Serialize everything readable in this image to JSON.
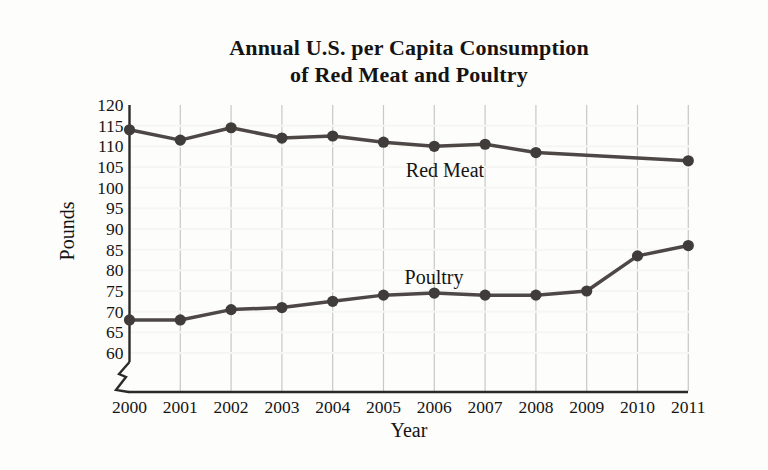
{
  "page": {
    "background": "#fdfdfc"
  },
  "chart_data": {
    "type": "line",
    "title": "Annual U.S. per Capita Consumption",
    "subtitle": "of Red Meat and Poultry",
    "xlabel": "Year",
    "ylabel": "Pounds",
    "x": [
      2000,
      2001,
      2002,
      2003,
      2004,
      2005,
      2006,
      2007,
      2008,
      2009,
      2010,
      2011
    ],
    "y_ticks": [
      120,
      115,
      110,
      105,
      100,
      95,
      90,
      85,
      80,
      75,
      70,
      65,
      60
    ],
    "ylim": [
      60,
      120
    ],
    "axis_break_at_bottom": true,
    "grid": {
      "horizontal": true,
      "vertical": true,
      "legend": "inline-labels"
    },
    "series": [
      {
        "name": "Red Meat",
        "label": "Red Meat",
        "label_anchor": {
          "x": 445,
          "y": 177
        },
        "points": [
          {
            "year": 2000,
            "value": 114
          },
          {
            "year": 2001,
            "value": 111.5
          },
          {
            "year": 2002,
            "value": 114.5
          },
          {
            "year": 2003,
            "value": 112
          },
          {
            "year": 2004,
            "value": 112.5
          },
          {
            "year": 2005,
            "value": 111
          },
          {
            "year": 2006,
            "value": 110
          },
          {
            "year": 2007,
            "value": 110.5
          },
          {
            "year": 2008,
            "value": 108.5
          },
          {
            "year": 2011,
            "value": 106.5
          }
        ]
      },
      {
        "name": "Poultry",
        "label": "Poultry",
        "label_anchor": {
          "x": 434,
          "y": 284
        },
        "points": [
          {
            "year": 2000,
            "value": 68
          },
          {
            "year": 2001,
            "value": 68
          },
          {
            "year": 2002,
            "value": 70.5
          },
          {
            "year": 2003,
            "value": 71
          },
          {
            "year": 2004,
            "value": 72.5
          },
          {
            "year": 2005,
            "value": 74
          },
          {
            "year": 2006,
            "value": 74.5
          },
          {
            "year": 2007,
            "value": 74
          },
          {
            "year": 2008,
            "value": 74
          },
          {
            "year": 2009,
            "value": 75
          },
          {
            "year": 2010,
            "value": 83.5
          },
          {
            "year": 2011,
            "value": 86
          }
        ]
      }
    ],
    "colors": {
      "line": "#4d4846",
      "marker": "#403c3a",
      "card_bg": "#e4e4e1",
      "grid_vertical": "#c8c8c5",
      "grid_horizontal": "#f6f6f3",
      "axis": "#2b2a28",
      "text": "#151413"
    },
    "layout": {
      "x0": 129.5,
      "x_step": 50.8,
      "y_top": 105,
      "px_per_lb": 4.1333,
      "axis_bottom_y": 392,
      "plot_right_x": 689,
      "y_axis_solid_end": 362
    }
  }
}
